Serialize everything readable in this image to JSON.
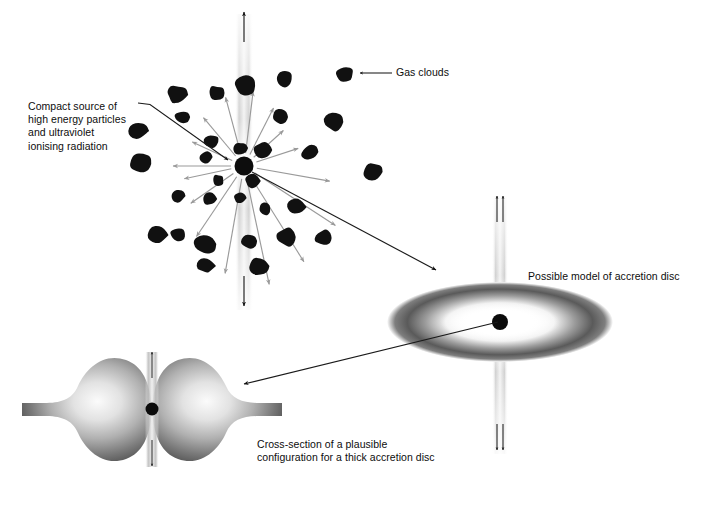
{
  "figure": {
    "background_color": "#ffffff",
    "ink_color": "#0d0d0d",
    "cloud_color": "#111111",
    "arrow_gray": "#9a9a9a",
    "jet_gray": "#c9c9c9",
    "width": 702,
    "height": 515
  },
  "labels": {
    "compact_source": "Compact source of\nhigh energy particles\nand ultraviolet\nionising radiation",
    "gas_clouds": "Gas clouds",
    "accretion_model": "Possible model of accretion disc",
    "cross_section": "Cross-section of a plausible\nconfiguration for a thick accretion disc"
  },
  "panels": [
    {
      "name": "gas-cloud-field",
      "description": "Compact central source with radial outflow arrows, vertical bipolar jet and surrounding gas clouds",
      "center": [
        244,
        166
      ],
      "jet_top_arrow": "up",
      "jet_bottom_arrow": "down",
      "radial_arrow_count": 16
    },
    {
      "name": "thin-accretion-disc",
      "description": "Elliptical accretion disc seen obliquely with central black hole and bipolar jets",
      "center": [
        500,
        322
      ],
      "jet_top_arrows": 2,
      "jet_bottom_arrows": 2
    },
    {
      "name": "thick-accretion-disc-cross-section",
      "description": "Cross-section of a thick accretion torus with funnel and bipolar jet",
      "center": [
        152,
        409
      ],
      "jet_top_arrow": "up",
      "jet_bottom_arrow": "down"
    }
  ],
  "connectors": [
    {
      "name": "compact-source-pointer",
      "from": [
        138,
        103
      ],
      "to": [
        228,
        160
      ],
      "style": "thin-arrow"
    },
    {
      "name": "source-to-disc-arrow",
      "from": [
        252,
        172
      ],
      "to": [
        436,
        270
      ],
      "style": "thin-arrow"
    },
    {
      "name": "disc-to-cross-section-arrow",
      "from": [
        498,
        322
      ],
      "to": [
        242,
        385
      ],
      "style": "thin-arrow"
    },
    {
      "name": "gas-cloud-pointer",
      "from": [
        392,
        73
      ],
      "to": [
        362,
        73
      ],
      "style": "thin-arrow"
    }
  ],
  "chart_data": {
    "type": "scatter",
    "xlabel": "",
    "ylabel": "",
    "grid": false,
    "legend": "none",
    "clouds": [
      {
        "x": 177,
        "y": 95,
        "r": 10.5
      },
      {
        "x": 216,
        "y": 93,
        "r": 8.5
      },
      {
        "x": 245,
        "y": 86,
        "r": 11.0
      },
      {
        "x": 284,
        "y": 79,
        "r": 9.0
      },
      {
        "x": 345,
        "y": 75,
        "r": 9.5
      },
      {
        "x": 137,
        "y": 131,
        "r": 10.5
      },
      {
        "x": 182,
        "y": 117,
        "r": 7.5
      },
      {
        "x": 280,
        "y": 117,
        "r": 8.0
      },
      {
        "x": 334,
        "y": 122,
        "r": 10.0
      },
      {
        "x": 141,
        "y": 164,
        "r": 12.0
      },
      {
        "x": 212,
        "y": 142,
        "r": 8.0
      },
      {
        "x": 240,
        "y": 148,
        "r": 7.0
      },
      {
        "x": 263,
        "y": 150,
        "r": 8.5
      },
      {
        "x": 206,
        "y": 157,
        "r": 6.5
      },
      {
        "x": 310,
        "y": 152,
        "r": 9.0
      },
      {
        "x": 374,
        "y": 172,
        "r": 10.0
      },
      {
        "x": 218,
        "y": 180,
        "r": 6.5
      },
      {
        "x": 252,
        "y": 181,
        "r": 7.5
      },
      {
        "x": 209,
        "y": 199,
        "r": 7.5
      },
      {
        "x": 240,
        "y": 198,
        "r": 6.5
      },
      {
        "x": 178,
        "y": 196,
        "r": 8.0
      },
      {
        "x": 178,
        "y": 234,
        "r": 8.0
      },
      {
        "x": 265,
        "y": 209,
        "r": 6.5
      },
      {
        "x": 296,
        "y": 207,
        "r": 9.0
      },
      {
        "x": 157,
        "y": 235,
        "r": 10.5
      },
      {
        "x": 205,
        "y": 244,
        "r": 11.0
      },
      {
        "x": 249,
        "y": 241,
        "r": 8.5
      },
      {
        "x": 287,
        "y": 237,
        "r": 10.0
      },
      {
        "x": 324,
        "y": 238,
        "r": 9.5
      },
      {
        "x": 206,
        "y": 266,
        "r": 8.5
      },
      {
        "x": 259,
        "y": 266,
        "r": 9.5
      }
    ],
    "radial_arrows": [
      {
        "angle_deg": 255,
        "length": 58
      },
      {
        "angle_deg": 277,
        "length": 62
      },
      {
        "angle_deg": 297,
        "length": 52
      },
      {
        "angle_deg": 318,
        "length": 40
      },
      {
        "angle_deg": 342,
        "length": 44
      },
      {
        "angle_deg": 10,
        "length": 74
      },
      {
        "angle_deg": 33,
        "length": 96
      },
      {
        "angle_deg": 58,
        "length": 100
      },
      {
        "angle_deg": 78,
        "length": 108
      },
      {
        "angle_deg": 100,
        "length": 96
      },
      {
        "angle_deg": 124,
        "length": 72
      },
      {
        "angle_deg": 145,
        "length": 52
      },
      {
        "angle_deg": 168,
        "length": 48
      },
      {
        "angle_deg": 180,
        "length": 58
      },
      {
        "angle_deg": 205,
        "length": 44
      },
      {
        "angle_deg": 230,
        "length": 50
      }
    ]
  }
}
